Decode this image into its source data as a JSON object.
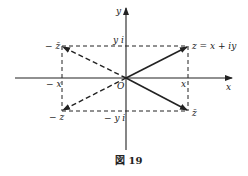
{
  "diagram": {
    "caption": "図 19",
    "axes": {
      "x_label": "x",
      "y_label": "y",
      "origin_label": "O"
    },
    "points": {
      "z": {
        "label": "z = x + iy"
      },
      "z_conj": {
        "label": "z̄"
      },
      "neg_z_conj": {
        "label": "− z̄"
      },
      "neg_z": {
        "label": "− z"
      }
    },
    "tick_labels": {
      "x": "x",
      "neg_x": "− x",
      "yi": "y i",
      "neg_yi": "− y i"
    },
    "vectors": [
      {
        "to": "z",
        "style": "solid"
      },
      {
        "to": "z_conj",
        "style": "solid"
      },
      {
        "to": "neg_z_conj",
        "style": "dashed"
      },
      {
        "to": "neg_z",
        "style": "dashed"
      }
    ],
    "colors": {
      "ink": "#222222",
      "background": "#ffffff"
    }
  }
}
